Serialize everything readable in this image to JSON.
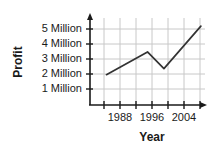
{
  "chart_data": {
    "type": "line",
    "title": "",
    "xlabel": "Year",
    "ylabel": "Profit",
    "grid": true,
    "legend": "none",
    "xlim": [
      1984,
      2012
    ],
    "ylim": [
      0,
      6
    ],
    "x_tick_labels": [
      "1988",
      "1996",
      "2004"
    ],
    "x_tick_values": [
      1988,
      1996,
      2004
    ],
    "y_tick_labels": [
      "1 Million",
      "2 Million",
      "3 Million",
      "4 Million",
      "5 Million"
    ],
    "y_tick_values": [
      1,
      2,
      3,
      4,
      5
    ],
    "series": [
      {
        "name": "Profit",
        "x": [
          1988,
          1998,
          2002,
          2011
        ],
        "values": [
          2.0,
          3.5,
          2.4,
          5.2
        ]
      }
    ],
    "x_axis_arrow": true,
    "y_axis_arrow": true,
    "line_color": "#333333",
    "grid_color": "#c8c8c8",
    "axis_color": "#1a1a1a"
  },
  "labels": {
    "y_title": "Profit",
    "x_title": "Year",
    "y0": "1 Million",
    "y1": "2 Million",
    "y2": "3 Million",
    "y3": "4 Million",
    "y4": "5 Million",
    "x0": "1988",
    "x1": "1996",
    "x2": "2004"
  }
}
